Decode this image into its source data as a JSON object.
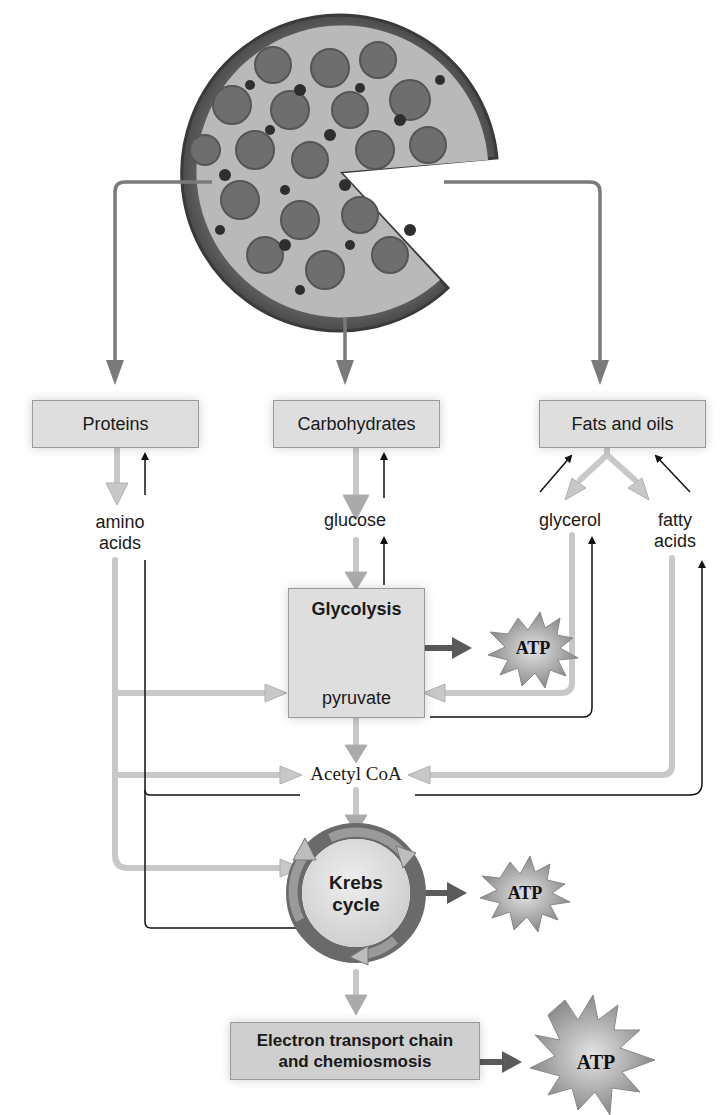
{
  "figure": {
    "source_image": "pizza-icon",
    "food_groups": [
      {
        "id": "proteins",
        "label": "Proteins"
      },
      {
        "id": "carbohydrates",
        "label": "Carbohydrates"
      },
      {
        "id": "fats",
        "label": "Fats and oils"
      }
    ],
    "monomers": {
      "amino_acids": "amino\nacids",
      "glucose": "glucose",
      "glycerol": "glycerol",
      "fatty_acids": "fatty\nacids"
    },
    "glycolysis": {
      "title": "Glycolysis",
      "product": "pyruvate"
    },
    "acetyl_coa": "Acetyl CoA",
    "krebs": {
      "line1": "Krebs",
      "line2": "cycle"
    },
    "etc": {
      "line1": "Electron transport chain",
      "line2": "and chemiosmosis"
    },
    "atp": [
      "ATP",
      "ATP",
      "ATP"
    ],
    "colors": {
      "catabolic_arrow": "#c8c8c8",
      "main_arrow": "#7a7a7a",
      "anabolic_arrow": "#111111",
      "box_fill": "#dedede",
      "atp_fill": "#a8a8a8"
    }
  }
}
